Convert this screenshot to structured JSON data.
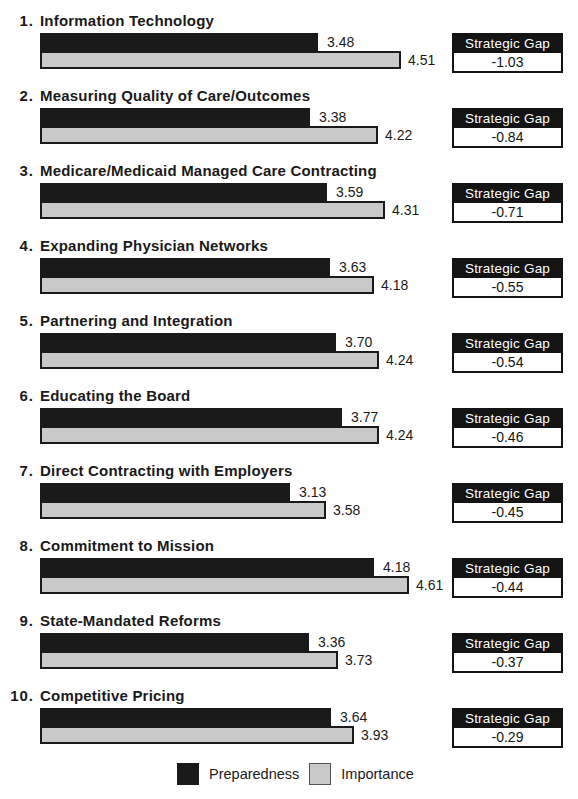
{
  "chart_data": {
    "type": "bar",
    "orientation": "horizontal",
    "title": "",
    "series_names": [
      "Preparedness",
      "Importance"
    ],
    "xlim": [
      0,
      5
    ],
    "px_per_unit": 80,
    "row_pitch_px": 75,
    "grid": false,
    "gap_box_title": "Strategic Gap",
    "legend": {
      "position": "bottom-center",
      "items": [
        {
          "label": "Preparedness",
          "color": "#1a1a1a"
        },
        {
          "label": "Importance",
          "color": "#c9c9c9"
        }
      ]
    },
    "items": [
      {
        "rank": "1.",
        "label": "Information Technology",
        "preparedness": 3.48,
        "importance": 4.51,
        "strategic_gap": -1.03,
        "preparedness_text": "3.48",
        "importance_text": "4.51",
        "gap_text": "-1.03"
      },
      {
        "rank": "2.",
        "label": "Measuring Quality of Care/Outcomes",
        "preparedness": 3.38,
        "importance": 4.22,
        "strategic_gap": -0.84,
        "preparedness_text": "3.38",
        "importance_text": "4.22",
        "gap_text": "-0.84"
      },
      {
        "rank": "3.",
        "label": "Medicare/Medicaid Managed Care Contracting",
        "preparedness": 3.59,
        "importance": 4.31,
        "strategic_gap": -0.71,
        "preparedness_text": "3.59",
        "importance_text": "4.31",
        "gap_text": "-0.71"
      },
      {
        "rank": "4.",
        "label": "Expanding Physician Networks",
        "preparedness": 3.63,
        "importance": 4.18,
        "strategic_gap": -0.55,
        "preparedness_text": "3.63",
        "importance_text": "4.18",
        "gap_text": "-0.55"
      },
      {
        "rank": "5.",
        "label": "Partnering and Integration",
        "preparedness": 3.7,
        "importance": 4.24,
        "strategic_gap": -0.54,
        "preparedness_text": "3.70",
        "importance_text": "4.24",
        "gap_text": "-0.54"
      },
      {
        "rank": "6.",
        "label": "Educating the Board",
        "preparedness": 3.77,
        "importance": 4.24,
        "strategic_gap": -0.46,
        "preparedness_text": "3.77",
        "importance_text": "4.24",
        "gap_text": "-0.46"
      },
      {
        "rank": "7.",
        "label": "Direct Contracting with Employers",
        "preparedness": 3.13,
        "importance": 3.58,
        "strategic_gap": -0.45,
        "preparedness_text": "3.13",
        "importance_text": "3.58",
        "gap_text": "-0.45"
      },
      {
        "rank": "8.",
        "label": "Commitment to Mission",
        "preparedness": 4.18,
        "importance": 4.61,
        "strategic_gap": -0.44,
        "preparedness_text": "4.18",
        "importance_text": "4.61",
        "gap_text": "-0.44"
      },
      {
        "rank": "9.",
        "label": "State-Mandated Reforms",
        "preparedness": 3.36,
        "importance": 3.73,
        "strategic_gap": -0.37,
        "preparedness_text": "3.36",
        "importance_text": "3.73",
        "gap_text": "-0.37"
      },
      {
        "rank": "10.",
        "label": "Competitive Pricing",
        "preparedness": 3.64,
        "importance": 3.93,
        "strategic_gap": -0.29,
        "preparedness_text": "3.64",
        "importance_text": "3.93",
        "gap_text": "-0.29"
      }
    ]
  },
  "colors": {
    "preparedness_bar": "#1a1a1a",
    "importance_bar": "#c9c9c9",
    "bar_border": "#1a1a1a",
    "gap_header_bg": "#141414",
    "gap_header_text": "#ffffff",
    "text": "#1a1a1a",
    "background": "#ffffff"
  }
}
